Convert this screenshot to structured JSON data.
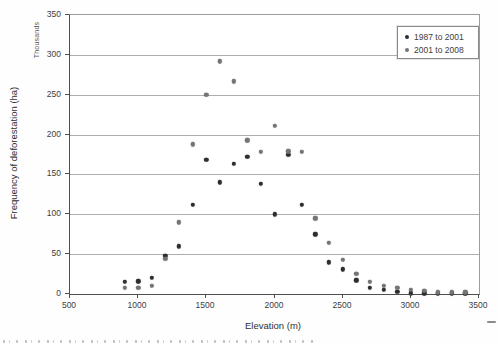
{
  "figure": {
    "y_unit_label": "Thousands",
    "y_axis_title": "Frequency of deforestation (ha)",
    "x_axis_title": "Elevation (m)"
  },
  "chart_data": {
    "type": "scatter",
    "title": "",
    "xlabel": "Elevation (m)",
    "ylabel": "Frequency of deforestation (ha)",
    "y_unit": "Thousands",
    "xlim": [
      500,
      3500
    ],
    "ylim": [
      0,
      350
    ],
    "x_ticks": [
      500,
      1000,
      1500,
      2000,
      2500,
      3000,
      3500
    ],
    "y_ticks": [
      0,
      50,
      100,
      150,
      200,
      250,
      300,
      350
    ],
    "grid": "horizontal-only",
    "legend_position": "top-right-inside",
    "x": [
      900,
      1000,
      1100,
      1200,
      1300,
      1400,
      1500,
      1600,
      1700,
      1800,
      1900,
      2000,
      2100,
      2200,
      2300,
      2400,
      2500,
      2600,
      2700,
      2800,
      2900,
      3000,
      3100,
      3200,
      3300,
      3400
    ],
    "series": [
      {
        "name": "1987 to 2001",
        "color": "#2e2e2e",
        "values": [
          15,
          16,
          20,
          48,
          60,
          112,
          168,
          140,
          163,
          172,
          138,
          100,
          175,
          112,
          75,
          40,
          31,
          17,
          8,
          5,
          3,
          1,
          1,
          1,
          1,
          1
        ]
      },
      {
        "name": "2001 to 2008",
        "color": "#757575",
        "values": [
          8,
          8,
          10,
          44,
          90,
          188,
          250,
          292,
          267,
          193,
          178,
          211,
          179,
          178,
          95,
          64,
          43,
          25,
          15,
          10,
          8,
          5,
          4,
          2,
          2,
          2
        ]
      }
    ]
  }
}
